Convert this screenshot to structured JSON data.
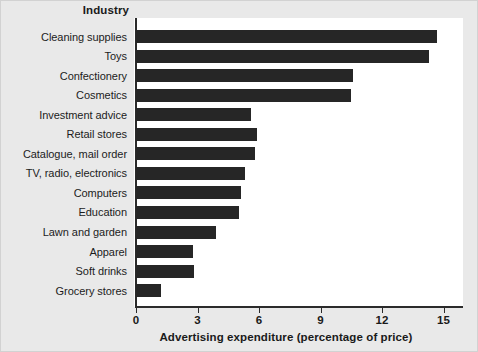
{
  "chart_data": {
    "type": "bar",
    "orientation": "horizontal",
    "title": "",
    "xlabel": "Advertising expenditure (percentage of price)",
    "ylabel": "Industry",
    "xlim": [
      0,
      16
    ],
    "xticks": [
      0,
      3,
      6,
      9,
      12,
      15
    ],
    "xtick_labels": [
      "0",
      "3",
      "6",
      "9",
      "12",
      "15"
    ],
    "grid": false,
    "legend": null,
    "bar_color": "#262626",
    "panel_color": "#ffffff",
    "figure_color": "#e9e9e9",
    "categories": [
      "Cleaning supplies",
      "Toys",
      "Confectionery",
      "Cosmetics",
      "Investment advice",
      "Retail stores",
      "Catalogue, mail order",
      "TV, radio, electronics",
      "Computers",
      "Education",
      "Lawn and garden",
      "Apparel",
      "Soft drinks",
      "Grocery stores"
    ],
    "values": [
      14.7,
      14.3,
      10.6,
      10.5,
      5.6,
      5.9,
      5.8,
      5.3,
      5.1,
      5.0,
      3.9,
      2.8,
      2.85,
      1.2
    ]
  },
  "axes": {
    "y_header": "Industry",
    "x_title": "Advertising expenditure (percentage of price)"
  }
}
